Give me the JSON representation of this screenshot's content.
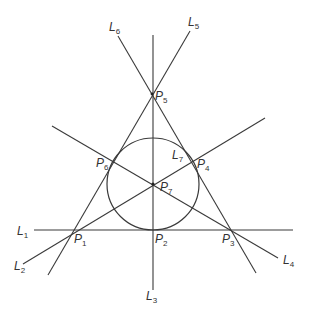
{
  "diagram": {
    "title": "",
    "colors": {
      "stroke": "#3a3a3a",
      "text": "#333333",
      "background": "#ffffff"
    },
    "lines": [
      {
        "id": "L1",
        "letter": "L",
        "sub": "1"
      },
      {
        "id": "L2",
        "letter": "L",
        "sub": "2"
      },
      {
        "id": "L3",
        "letter": "L",
        "sub": "3"
      },
      {
        "id": "L4",
        "letter": "L",
        "sub": "4"
      },
      {
        "id": "L5",
        "letter": "L",
        "sub": "5"
      },
      {
        "id": "L6",
        "letter": "L",
        "sub": "6"
      },
      {
        "id": "L7",
        "letter": "L",
        "sub": "7"
      }
    ],
    "points": [
      {
        "id": "P1",
        "letter": "P",
        "sub": "1"
      },
      {
        "id": "P2",
        "letter": "P",
        "sub": "2"
      },
      {
        "id": "P3",
        "letter": "P",
        "sub": "3"
      },
      {
        "id": "P4",
        "letter": "P",
        "sub": "4"
      },
      {
        "id": "P5",
        "letter": "P",
        "sub": "5"
      },
      {
        "id": "P6",
        "letter": "P",
        "sub": "6"
      },
      {
        "id": "P7",
        "letter": "P",
        "sub": "7"
      }
    ]
  }
}
